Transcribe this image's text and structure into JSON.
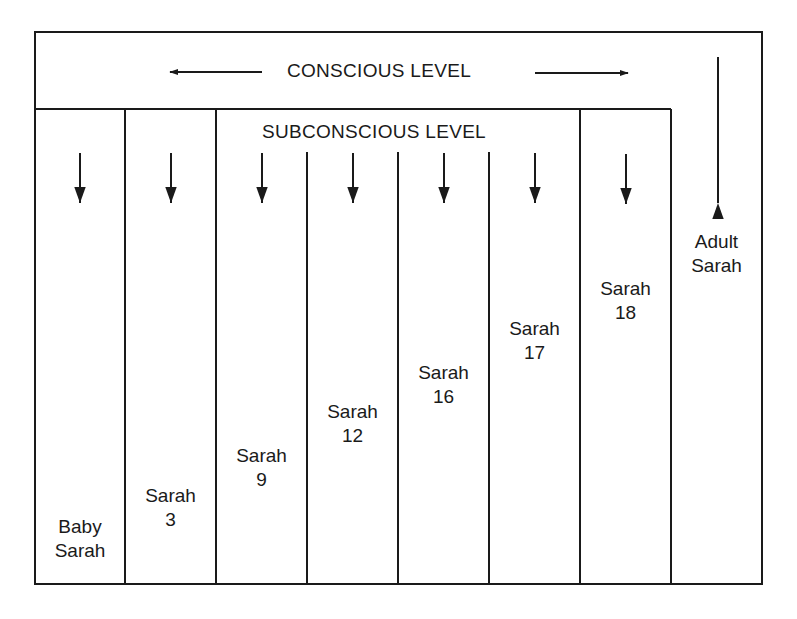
{
  "diagram": {
    "conscious_label": "CONSCIOUS LEVEL",
    "subconscious_label": "SUBCONSCIOUS LEVEL",
    "columns": [
      {
        "line1": "Baby",
        "line2": "Sarah"
      },
      {
        "line1": "Sarah",
        "line2": "3"
      },
      {
        "line1": "Sarah",
        "line2": "9"
      },
      {
        "line1": "Sarah",
        "line2": "12"
      },
      {
        "line1": "Sarah",
        "line2": "16"
      },
      {
        "line1": "Sarah",
        "line2": "17"
      },
      {
        "line1": "Sarah",
        "line2": "18"
      }
    ],
    "adult": {
      "line1": "Adult",
      "line2": "Sarah"
    },
    "arrows": {
      "conscious_left": "left-arrow",
      "conscious_right": "right-arrow",
      "subconscious_columns": "down-arrow",
      "adult_column": "up-arrow"
    },
    "colors": {
      "line": "#1a1a1a",
      "background": "#ffffff"
    }
  }
}
